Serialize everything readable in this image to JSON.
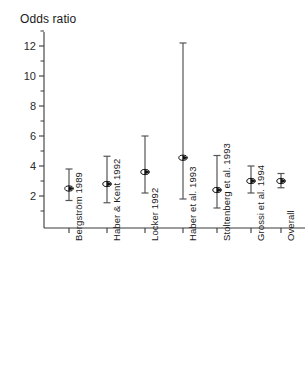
{
  "chart_data": {
    "type": "scatter",
    "title": "Odds ratio",
    "subtitle": "",
    "xlabel": "",
    "ylabel": "Odds ratio",
    "ylim": [
      0.6,
      13.2
    ],
    "grid": false,
    "legend": "none",
    "error_bars": "95% confidence interval",
    "marker": "open-circle-with-arrow",
    "categories": [
      "Bergström 1989",
      "Haber & Kent 1992",
      "Locker 1992",
      "Haber et al. 1993",
      "Stoltenberg et al. 1993",
      "Grossi et al. 1994",
      "Overall"
    ],
    "values": [
      2.5,
      2.8,
      3.6,
      4.55,
      2.4,
      3.0,
      3.0
    ],
    "ci_low": [
      1.7,
      1.55,
      2.2,
      1.8,
      1.2,
      2.2,
      2.55
    ],
    "ci_high": [
      3.8,
      4.65,
      6.0,
      12.2,
      4.7,
      4.0,
      3.5
    ],
    "y_ticks_major": [
      2,
      4,
      6,
      8,
      10,
      12
    ],
    "y_tick_labels": [
      "2",
      "4",
      "6",
      "8",
      "10",
      "12"
    ],
    "y_ticks_minor": [
      1,
      3,
      5,
      7,
      9,
      11,
      13
    ],
    "points": [
      {
        "label": "Bergström 1989",
        "or": 2.5,
        "low": 1.7,
        "high": 3.8
      },
      {
        "label": "Haber & Kent 1992",
        "or": 2.8,
        "low": 1.55,
        "high": 4.65
      },
      {
        "label": "Locker 1992",
        "or": 3.6,
        "low": 2.2,
        "high": 6.0
      },
      {
        "label": "Haber et al. 1993",
        "or": 4.55,
        "low": 1.8,
        "high": 12.2
      },
      {
        "label": "Stoltenberg et al. 1993",
        "or": 2.4,
        "low": 1.2,
        "high": 4.7
      },
      {
        "label": "Grossi et al. 1994",
        "or": 3.0,
        "low": 2.2,
        "high": 4.0
      },
      {
        "label": "Overall",
        "or": 3.0,
        "low": 2.55,
        "high": 3.5
      }
    ]
  },
  "axis": {
    "title": "Odds ratio",
    "tick_labels": [
      "12",
      "10",
      "8",
      "6",
      "4",
      "2"
    ]
  },
  "colors": {
    "axis": "#3a3a3a",
    "marker": "#111111",
    "error_bar": "#555555",
    "text": "#1a1a1a",
    "background": "#ffffff"
  }
}
